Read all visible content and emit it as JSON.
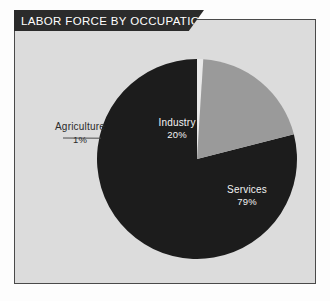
{
  "panel": {
    "title": "LABOR FORCE BY OCCUPATION",
    "background_color": "#dcdcdc",
    "border_color": "#4a4a4a",
    "banner_color": "#2b2b2b",
    "banner_text_color": "#ffffff"
  },
  "chart_data": {
    "type": "pie",
    "title": "LABOR FORCE BY OCCUPATION",
    "xlabel": "",
    "ylabel": "",
    "categories": [
      "Services",
      "Industry",
      "Agriculture"
    ],
    "values": [
      79,
      20,
      1
    ],
    "value_labels": [
      "79%",
      "20%",
      "1%"
    ],
    "colors": [
      "#1c1c1c",
      "#9a9a9a",
      "#e8e8e8"
    ],
    "legend": "none",
    "grid": false,
    "start_angle_deg": 0,
    "direction": "counterclockwise",
    "slices": [
      {
        "name": "Services",
        "value": 79,
        "value_label": "79%",
        "color": "#1c1c1c",
        "label_placement": "inside",
        "label_color": "#f2f2f2"
      },
      {
        "name": "Industry",
        "value": 20,
        "value_label": "20%",
        "color": "#9a9a9a",
        "label_placement": "inside",
        "label_color": "#f4f4f4"
      },
      {
        "name": "Agriculture",
        "value": 1,
        "value_label": "1%",
        "color": "#e8e8e8",
        "label_placement": "outside-leader",
        "label_color": "#2b2b2b"
      }
    ]
  },
  "labels": {
    "industry": {
      "name": "Industry",
      "value": "20%"
    },
    "services": {
      "name": "Services",
      "value": "79%"
    },
    "agriculture": {
      "name": "Agriculture",
      "value": "1%"
    }
  }
}
